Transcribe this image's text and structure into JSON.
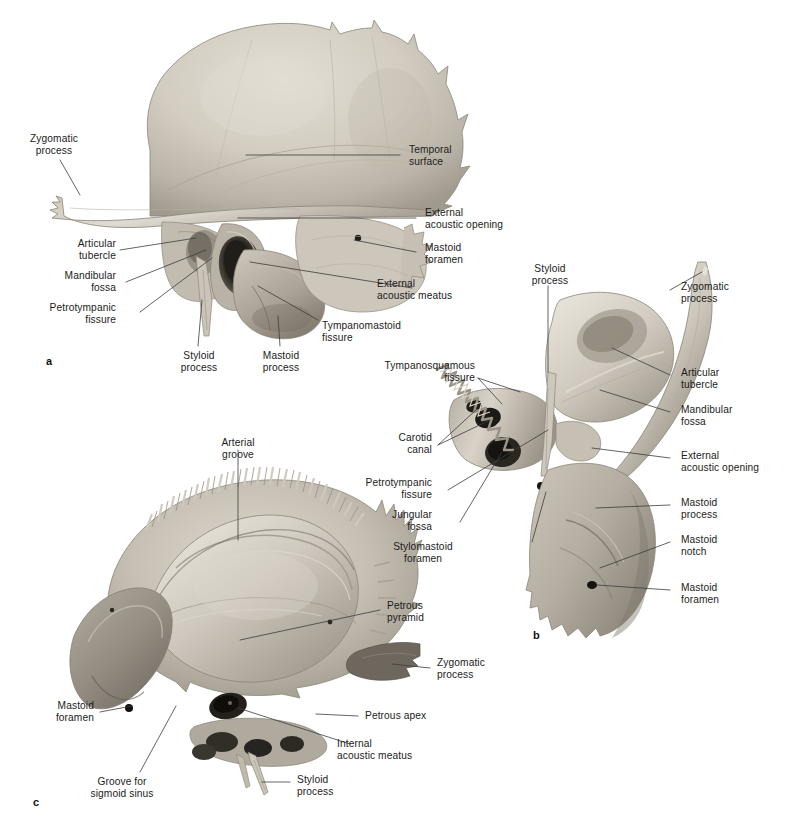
{
  "figure": {
    "background_color": "#ffffff",
    "text_color": "#1c1c1c",
    "leader_color": "#3c3c3c",
    "bone_light": "#d9d4cb",
    "bone_mid": "#b3aca1",
    "bone_dark": "#7d776e",
    "bone_shadow": "#4a463f",
    "cavity_black": "#1a1917"
  },
  "panels": [
    {
      "id": "a",
      "letter": "a",
      "labels": [
        {
          "key": "a_zygomatic_process",
          "text": "Zygomatic\nprocess",
          "align": "center"
        },
        {
          "key": "a_articular_tubercle",
          "text": "Articular\ntubercle",
          "align": "right"
        },
        {
          "key": "a_mandibular_fossa",
          "text": "Mandibular\nfossa",
          "align": "right"
        },
        {
          "key": "a_petrotympanic",
          "text": "Petrotympanic\nfissure",
          "align": "right"
        },
        {
          "key": "a_styloid_process",
          "text": "Styloid\nprocess",
          "align": "center"
        },
        {
          "key": "a_mastoid_process",
          "text": "Mastoid\nprocess",
          "align": "center"
        },
        {
          "key": "a_temporal_surface",
          "text": "Temporal\nsurface",
          "align": "left"
        },
        {
          "key": "a_ext_acoustic_opening",
          "text": "External\nacoustic opening",
          "align": "left"
        },
        {
          "key": "a_mastoid_foramen",
          "text": "Mastoid\nforamen",
          "align": "left"
        },
        {
          "key": "a_ext_acoustic_meatus",
          "text": "External\nacoustic meatus",
          "align": "left"
        },
        {
          "key": "a_tympanomastoid",
          "text": "Tympanomastoid\nfissure",
          "align": "left"
        }
      ]
    },
    {
      "id": "b",
      "letter": "b",
      "labels": [
        {
          "key": "b_styloid_process",
          "text": "Styloid\nprocess",
          "align": "center"
        },
        {
          "key": "b_tympanosquamous",
          "text": "Tympanosquamous\nfissure",
          "align": "right"
        },
        {
          "key": "b_carotid_canal",
          "text": "Carotid\ncanal",
          "align": "right"
        },
        {
          "key": "b_petrotympanic",
          "text": "Petrotympanic\nfissure",
          "align": "right"
        },
        {
          "key": "b_jungular_fossa",
          "text": "Jungular\nfossa",
          "align": "right"
        },
        {
          "key": "b_stylomastoid",
          "text": "Stylomastoid\nforamen",
          "align": "center"
        },
        {
          "key": "b_zygomatic_process",
          "text": "Zygomatic\nprocess",
          "align": "left"
        },
        {
          "key": "b_articular_tubercle",
          "text": "Articular\ntubercle",
          "align": "left"
        },
        {
          "key": "b_mandibular_fossa",
          "text": "Mandibular\nfossa",
          "align": "left"
        },
        {
          "key": "b_ext_acoustic_opening",
          "text": "External\nacoustic opening",
          "align": "left"
        },
        {
          "key": "b_mastoid_process",
          "text": "Mastoid\nprocess",
          "align": "left"
        },
        {
          "key": "b_mastoid_notch",
          "text": "Mastoid\nnotch",
          "align": "left"
        },
        {
          "key": "b_mastoid_foramen",
          "text": "Mastoid\nforamen",
          "align": "left"
        }
      ]
    },
    {
      "id": "c",
      "letter": "c",
      "labels": [
        {
          "key": "c_arterial_groove",
          "text": "Arterial\ngroove",
          "align": "center"
        },
        {
          "key": "c_mastoid_foramen",
          "text": "Mastoid\nforamen",
          "align": "right"
        },
        {
          "key": "c_groove_sigmoid",
          "text": "Groove for\nsigmoid sinus",
          "align": "center"
        },
        {
          "key": "c_petrous_pyramid",
          "text": "Petrous\npyramid",
          "align": "left"
        },
        {
          "key": "c_zygomatic_process",
          "text": "Zygomatic\nprocess",
          "align": "left"
        },
        {
          "key": "c_petrous_apex",
          "text": "Petrous apex",
          "align": "left"
        },
        {
          "key": "c_internal_meatus",
          "text": "Internal\nacoustic meatus",
          "align": "left"
        },
        {
          "key": "c_styloid_process",
          "text": "Styloid\nprocess",
          "align": "left"
        }
      ]
    }
  ],
  "labels": {
    "a_zygomatic_process": "Zygomatic\nprocess",
    "a_articular_tubercle": "Articular\ntubercle",
    "a_mandibular_fossa": "Mandibular\nfossa",
    "a_petrotympanic": "Petrotympanic\nfissure",
    "a_styloid_process": "Styloid\nprocess",
    "a_mastoid_process": "Mastoid\nprocess",
    "a_temporal_surface": "Temporal\nsurface",
    "a_ext_acoustic_opening": "External\nacoustic opening",
    "a_mastoid_foramen": "Mastoid\nforamen",
    "a_ext_acoustic_meatus": "External\nacoustic meatus",
    "a_tympanomastoid": "Tympanomastoid\nfissure",
    "b_styloid_process": "Styloid\nprocess",
    "b_tympanosquamous": "Tympanosquamous\nfissure",
    "b_carotid_canal": "Carotid\ncanal",
    "b_petrotympanic": "Petrotympanic\nfissure",
    "b_jungular_fossa": "Jungular\nfossa",
    "b_stylomastoid": "Stylomastoid\nforamen",
    "b_zygomatic_process": "Zygomatic\nprocess",
    "b_articular_tubercle": "Articular\ntubercle",
    "b_mandibular_fossa": "Mandibular\nfossa",
    "b_ext_acoustic_opening": "External\nacoustic opening",
    "b_mastoid_process": "Mastoid\nprocess",
    "b_mastoid_notch": "Mastoid\nnotch",
    "b_mastoid_foramen": "Mastoid\nforamen",
    "c_arterial_groove": "Arterial\ngroove",
    "c_mastoid_foramen": "Mastoid\nforamen",
    "c_groove_sigmoid": "Groove for\nsigmoid sinus",
    "c_petrous_pyramid": "Petrous\npyramid",
    "c_zygomatic_process": "Zygomatic\nprocess",
    "c_petrous_apex": "Petrous apex",
    "c_internal_meatus": "Internal\nacoustic meatus",
    "c_styloid_process": "Styloid\nprocess"
  },
  "panel_letters": {
    "a": "a",
    "b": "b",
    "c": "c"
  }
}
